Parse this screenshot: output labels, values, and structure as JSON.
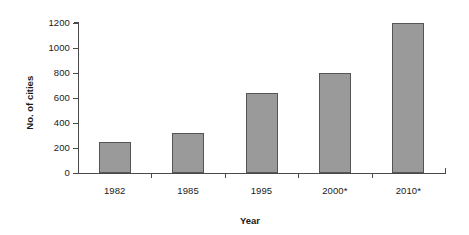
{
  "chart_data": {
    "type": "bar",
    "title": "",
    "subtitle": "",
    "xlabel": "Year",
    "ylabel": "No. of cities",
    "categories": [
      "1982",
      "1985",
      "1995",
      "2000*",
      "2010*"
    ],
    "values": [
      250,
      320,
      640,
      800,
      1200
    ],
    "series": [
      {
        "name": "No. of cities",
        "values": [
          250,
          320,
          640,
          800,
          1200
        ]
      }
    ],
    "ylim": [
      0,
      1200
    ],
    "ytick_values": [
      0,
      200,
      400,
      600,
      800,
      1000,
      1200
    ],
    "ytick_labels": [
      "0",
      "200",
      "400",
      "600",
      "800",
      "1000",
      "1200"
    ],
    "grid": false,
    "legend": false,
    "legend_position": "none",
    "annotations": [],
    "colors": {
      "bar_fill": "#9a9a9a",
      "bar_border": "#555555",
      "axis": "#4a4a4a",
      "text": "#1a1a1a",
      "background": "#ffffff"
    }
  }
}
